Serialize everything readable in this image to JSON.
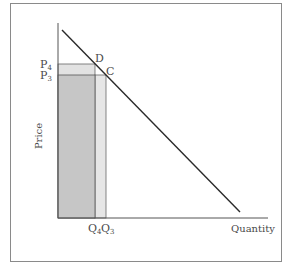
{
  "diagram": {
    "type": "demand-curve",
    "axes": {
      "x_label": "Quantity",
      "y_label": "Price"
    },
    "points": [
      {
        "label": "D",
        "price_label": "P4",
        "quantity_label": "Q4"
      },
      {
        "label": "C",
        "price_label": "P3",
        "quantity_label": "Q3"
      }
    ],
    "price_labels": {
      "p4_base": "P",
      "p4_sub": "4",
      "p3_base": "P",
      "p3_sub": "3"
    },
    "quantity_labels": {
      "q4_base": "Q",
      "q4_sub": "4",
      "q3_base": "Q",
      "q3_sub": "3"
    },
    "point_labels": {
      "d": "D",
      "c": "C"
    },
    "colors": {
      "dark_rect": "#c4c4c4",
      "light_rect": "#e4e4e4",
      "line": "#2a2a2a",
      "axis": "#555555",
      "frame": "#8a8a8a"
    }
  }
}
